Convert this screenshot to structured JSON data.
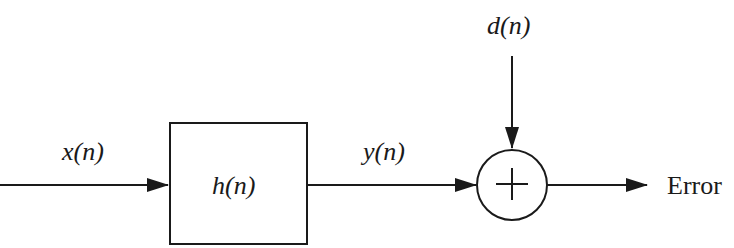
{
  "diagram": {
    "input_label": "x(n)",
    "filter_label": "h(n)",
    "filter_output_label": "y(n)",
    "desired_label": "d(n)",
    "summer_symbol": "+",
    "output_label": "Error"
  },
  "colors": {
    "stroke": "#1a1a1a",
    "background": "#ffffff"
  }
}
